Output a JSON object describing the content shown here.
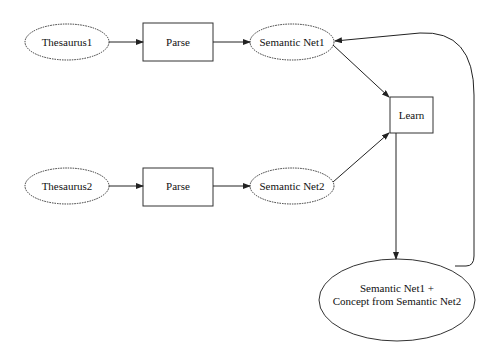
{
  "diagram": {
    "type": "flowchart",
    "nodes": [
      {
        "id": "thesaurus1",
        "label": "Thesaurus1",
        "shape": "ellipse-dashed"
      },
      {
        "id": "parse1",
        "label": "Parse",
        "shape": "rectangle"
      },
      {
        "id": "semnet1",
        "label": "Semantic Net1",
        "shape": "ellipse-dashed"
      },
      {
        "id": "learn",
        "label": "Learn",
        "shape": "rectangle"
      },
      {
        "id": "thesaurus2",
        "label": "Thesaurus2",
        "shape": "ellipse-dashed"
      },
      {
        "id": "parse2",
        "label": "Parse",
        "shape": "rectangle"
      },
      {
        "id": "semnet2",
        "label": "Semantic Net2",
        "shape": "ellipse-dashed"
      },
      {
        "id": "result",
        "label_line1": "Semantic Net1 +",
        "label_line2": "Concept from Semantic Net2",
        "shape": "ellipse"
      }
    ],
    "edges": [
      {
        "from": "thesaurus1",
        "to": "parse1"
      },
      {
        "from": "parse1",
        "to": "semnet1"
      },
      {
        "from": "semnet1",
        "to": "learn"
      },
      {
        "from": "thesaurus2",
        "to": "parse2"
      },
      {
        "from": "parse2",
        "to": "semnet2"
      },
      {
        "from": "semnet2",
        "to": "learn"
      },
      {
        "from": "learn",
        "to": "result"
      },
      {
        "from": "result",
        "to": "semnet1"
      }
    ]
  }
}
